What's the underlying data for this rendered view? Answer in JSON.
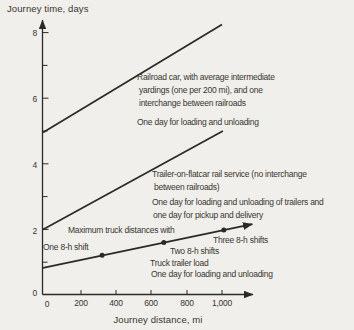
{
  "colors": {
    "background": "#f1efeb",
    "ink": "#2c2a26",
    "text": "#38362f"
  },
  "y_axis": {
    "title": "Journey time, days",
    "tick_labels": [
      "8",
      "6",
      "4",
      "2",
      "0"
    ]
  },
  "x_axis": {
    "title": "Journey distance, mi",
    "tick_labels": [
      "0",
      "200",
      "400",
      "600",
      "800",
      "1,000"
    ]
  },
  "annotations": {
    "railroad": {
      "line1": "Railroad car, with average intermediate",
      "line2": "yardings (one per 200 mi), and one",
      "line3": "interchange between railroads",
      "note": "One day for loading and unloading"
    },
    "trailer": {
      "line1": "Trailer-on-flatcar rail service (no interchange",
      "line2": "between railroads)",
      "note1": "One day for loading and unloading of trailers and",
      "note2": "one day for pickup and delivery"
    },
    "truck": {
      "heading": "Maximum truck distances with",
      "shift1": "One 8-h shift",
      "shift2": "Two 8-h shifts",
      "shift3": "Three 8-h shifts",
      "label": "Truck trailer load",
      "note": "One day for loading and unloading"
    }
  },
  "chart_data": {
    "type": "line",
    "title": "",
    "xlabel": "Journey distance, mi",
    "ylabel": "Journey time, days",
    "xlim": [
      0,
      1200
    ],
    "ylim": [
      0,
      8.5
    ],
    "x_ticks": [
      0,
      200,
      400,
      600,
      800,
      1000
    ],
    "y_ticks": [
      0,
      2,
      4,
      6,
      8
    ],
    "grid": false,
    "legend_position": "inline-annotations",
    "series": [
      {
        "name": "Railroad car, with average intermediate yardings (one per 200 mi), and one interchange between railroads; one day for loading and unloading",
        "slug": "railroad-car-line",
        "points": [
          [
            0,
            4.95
          ],
          [
            1000,
            8.25
          ]
        ],
        "arrow_end": false
      },
      {
        "name": "Trailer-on-flatcar rail service (no interchange between railroads); one day for loading and unloading of trailers and one day for pickup and delivery",
        "slug": "trailer-on-flatcar-line",
        "points": [
          [
            0,
            2.0
          ],
          [
            1005,
            5.0
          ]
        ],
        "arrow_end": false
      },
      {
        "name": "Truck trailer load; one day for loading and unloading",
        "slug": "truck-trailer-line",
        "points": [
          [
            0,
            0.83
          ],
          [
            1170,
            2.16
          ]
        ],
        "arrow_end": true,
        "markers": [
          {
            "label": "One 8-h shift",
            "point": [
              330,
              1.21
            ]
          },
          {
            "label": "Two 8-h shifts",
            "point": [
              675,
              1.6
            ]
          },
          {
            "label": "Three 8-h shifts",
            "point": [
              1010,
              1.98
            ]
          }
        ]
      }
    ]
  }
}
